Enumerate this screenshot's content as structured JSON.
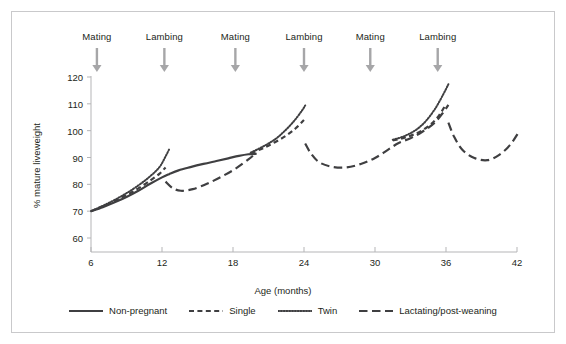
{
  "chart_data": {
    "type": "line",
    "title": "",
    "xlabel": "Age (months)",
    "ylabel": "% mature liveweight",
    "xlim": [
      5,
      43
    ],
    "ylim": [
      55,
      124
    ],
    "xticks": [
      6,
      12,
      18,
      24,
      30,
      36,
      42
    ],
    "yticks": [
      60,
      70,
      80,
      90,
      100,
      110,
      120
    ],
    "grid": false,
    "legend_position": "bottom",
    "annotations": [
      {
        "label": "Mating",
        "x": 6.5,
        "type": "arrow-down"
      },
      {
        "label": "Lambing",
        "x": 12.2,
        "type": "arrow-down"
      },
      {
        "label": "Mating",
        "x": 18.2,
        "type": "arrow-down"
      },
      {
        "label": "Lambing",
        "x": 24.0,
        "type": "arrow-down"
      },
      {
        "label": "Mating",
        "x": 29.6,
        "type": "arrow-down"
      },
      {
        "label": "Lambing",
        "x": 35.3,
        "type": "arrow-down"
      }
    ],
    "series": [
      {
        "name": "Non-pregnant",
        "style": "solid",
        "points": [
          [
            6.0,
            70.0
          ],
          [
            7.0,
            71.5
          ],
          [
            8.0,
            73.3
          ],
          [
            9.0,
            75.3
          ],
          [
            10.0,
            77.6
          ],
          [
            11.0,
            80.2
          ],
          [
            12.0,
            82.6
          ],
          [
            12.6,
            83.8
          ],
          [
            13.4,
            85.2
          ],
          [
            14.4,
            86.4
          ],
          [
            15.5,
            87.6
          ],
          [
            16.6,
            88.7
          ],
          [
            17.6,
            89.7
          ],
          [
            18.5,
            90.6
          ],
          [
            19.3,
            91.2
          ],
          [
            20.0,
            91.4
          ]
        ]
      },
      {
        "name": "Single",
        "style": "dashed",
        "segments": [
          [
            [
              6.0,
              70.0
            ],
            [
              7.0,
              71.8
            ],
            [
              8.0,
              73.8
            ],
            [
              9.0,
              76.0
            ],
            [
              10.0,
              78.5
            ],
            [
              11.0,
              81.4
            ],
            [
              11.8,
              84.0
            ],
            [
              12.3,
              86.3
            ]
          ],
          [
            [
              19.5,
              91.6
            ],
            [
              20.5,
              93.4
            ],
            [
              21.5,
              95.6
            ],
            [
              22.5,
              98.2
            ],
            [
              23.3,
              100.9
            ],
            [
              24.0,
              104.0
            ]
          ],
          [
            [
              31.5,
              96.4
            ],
            [
              32.5,
              97.4
            ],
            [
              33.5,
              99.0
            ],
            [
              34.5,
              101.6
            ],
            [
              35.3,
              105.0
            ],
            [
              36.0,
              109.8
            ]
          ]
        ]
      },
      {
        "name": "Twin",
        "style": "dotted",
        "segments": [
          [
            [
              6.0,
              70.0
            ],
            [
              7.0,
              72.0
            ],
            [
              8.0,
              74.2
            ],
            [
              9.0,
              76.7
            ],
            [
              10.0,
              79.6
            ],
            [
              11.0,
              83.0
            ],
            [
              11.8,
              86.5
            ],
            [
              12.3,
              90.4
            ],
            [
              12.6,
              93.0
            ]
          ],
          [
            [
              19.5,
              91.8
            ],
            [
              20.5,
              94.0
            ],
            [
              21.5,
              96.6
            ],
            [
              22.3,
              99.6
            ],
            [
              23.1,
              103.3
            ],
            [
              23.8,
              107.3
            ],
            [
              24.1,
              109.4
            ]
          ],
          [
            [
              31.5,
              96.6
            ],
            [
              32.5,
              98.0
            ],
            [
              33.5,
              100.4
            ],
            [
              34.3,
              103.6
            ],
            [
              35.1,
              108.3
            ],
            [
              35.8,
              113.8
            ],
            [
              36.2,
              117.3
            ]
          ]
        ]
      },
      {
        "name": "Lactating/post-weaning",
        "style": "long-dash",
        "segments": [
          [
            [
              12.3,
              81.0
            ],
            [
              12.9,
              78.6
            ],
            [
              13.6,
              77.6
            ],
            [
              14.6,
              78.2
            ],
            [
              15.8,
              80.2
            ],
            [
              17.0,
              82.8
            ],
            [
              18.2,
              85.8
            ],
            [
              19.3,
              89.3
            ],
            [
              19.9,
              91.5
            ]
          ],
          [
            [
              24.1,
              95.2
            ],
            [
              24.6,
              91.4
            ],
            [
              25.3,
              88.2
            ],
            [
              26.4,
              86.5
            ],
            [
              27.6,
              86.3
            ],
            [
              28.8,
              87.6
            ],
            [
              30.0,
              89.8
            ],
            [
              31.2,
              93.2
            ],
            [
              32.0,
              95.4
            ],
            [
              33.0,
              97.2
            ],
            [
              34.0,
              99.6
            ],
            [
              35.0,
              102.8
            ],
            [
              35.8,
              107.0
            ],
            [
              36.2,
              109.6
            ]
          ],
          [
            [
              36.2,
              103.0
            ],
            [
              36.7,
              97.6
            ],
            [
              37.4,
              92.8
            ],
            [
              38.4,
              89.8
            ],
            [
              39.5,
              89.0
            ],
            [
              40.5,
              91.0
            ],
            [
              41.4,
              94.6
            ],
            [
              42.2,
              99.8
            ]
          ]
        ]
      }
    ]
  },
  "legend": {
    "items": [
      {
        "label": "Non-pregnant",
        "style": "solid"
      },
      {
        "label": "Single",
        "style": "dashed"
      },
      {
        "label": "Twin",
        "style": "dotted"
      },
      {
        "label": "Lactating/post-weaning",
        "style": "long-dash"
      }
    ]
  },
  "colors": {
    "line": "#3f3f41",
    "axis": "#b5b5b7",
    "text": "#231f20",
    "arrow": "#a6a6a8",
    "frame": "#c9c9cb",
    "background": "#ffffff"
  }
}
